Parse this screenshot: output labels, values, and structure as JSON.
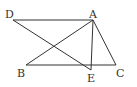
{
  "diagram": {
    "type": "geometry",
    "points": {
      "A": {
        "label": "A",
        "x": 93,
        "y": 20
      },
      "B": {
        "label": "B",
        "x": 26,
        "y": 65
      },
      "C": {
        "label": "C",
        "x": 116,
        "y": 65
      },
      "D": {
        "label": "D",
        "x": 13,
        "y": 20
      },
      "E": {
        "label": "E",
        "x": 91,
        "y": 70
      }
    },
    "segments": [
      [
        "D",
        "A"
      ],
      [
        "D",
        "E"
      ],
      [
        "A",
        "B"
      ],
      [
        "A",
        "E"
      ],
      [
        "A",
        "C"
      ],
      [
        "B",
        "C"
      ]
    ],
    "stroke_color": "#333333"
  }
}
